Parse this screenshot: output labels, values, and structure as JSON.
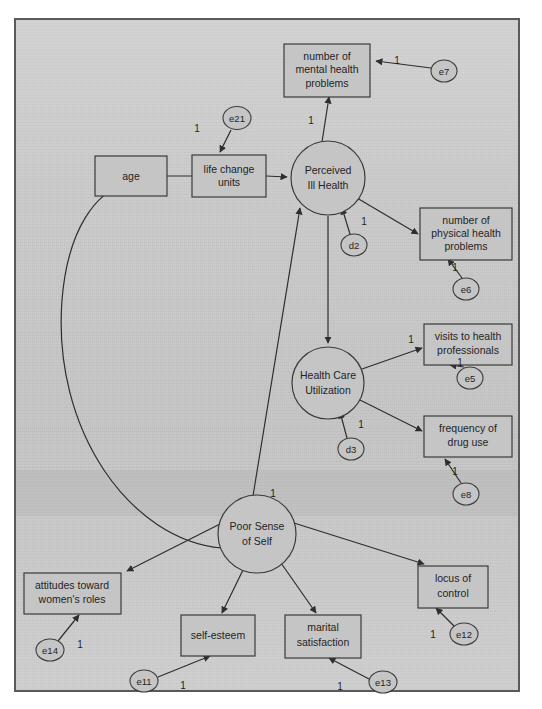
{
  "figure": {
    "kind": "path-diagram",
    "background_color": "#c9c9c9",
    "frame_border_color": "#5a5a5a",
    "shape_fill_color": "#c5c5c5",
    "line_color": "#2e2e2e",
    "text_color": "#242424"
  },
  "observed_variables": [
    {
      "id": "age",
      "label": "age",
      "x": 131,
      "y": 176,
      "w": 72,
      "h": 40
    },
    {
      "id": "life_change_units",
      "label_line1": "life change",
      "label_line2": "units",
      "x": 229,
      "y": 176,
      "w": 74,
      "h": 42
    },
    {
      "id": "mental_health_problems",
      "label_line1": "number of",
      "label_line2": "mental health",
      "label_line3": "problems",
      "x": 327,
      "y": 68,
      "w": 86,
      "h": 48
    },
    {
      "id": "physical_health_problems",
      "label_line1": "number of",
      "label_line2": "physical health",
      "label_line3": "problems",
      "x": 466,
      "y": 232,
      "w": 92,
      "h": 48
    },
    {
      "id": "visits_to_health_professionals",
      "label_line1": "visits to health",
      "label_line2": "professionals",
      "x": 470,
      "y": 344,
      "w": 88,
      "h": 38
    },
    {
      "id": "frequency_of_drug_use",
      "label_line1": "frequency of",
      "label_line2": "drug use",
      "x": 470,
      "y": 437,
      "w": 88,
      "h": 38
    },
    {
      "id": "attitudes_toward_womens_roles",
      "label_line1": "attitudes toward",
      "label_line2": "women's roles",
      "x": 72,
      "y": 593,
      "w": 97,
      "h": 38
    },
    {
      "id": "self_esteem",
      "label": "self-esteem",
      "x": 218,
      "y": 636,
      "w": 74,
      "h": 36
    },
    {
      "id": "marital_satisfaction",
      "label_line1": "marital",
      "label_line2": "satisfaction",
      "x": 323,
      "y": 636,
      "w": 76,
      "h": 38
    },
    {
      "id": "locus_of_control",
      "label_line1": "locus of",
      "label_line2": "control",
      "x": 452,
      "y": 586,
      "w": 70,
      "h": 38
    }
  ],
  "latent_variables": [
    {
      "id": "perceived_ill_health",
      "label_line1": "Perceived",
      "label_line2": "Ill Health",
      "cx": 328,
      "cy": 178,
      "r": 37
    },
    {
      "id": "health_care_utilization",
      "label_line1": "Health Care",
      "label_line2": "Utilization",
      "cx": 328,
      "cy": 383,
      "r": 36
    },
    {
      "id": "poor_sense_of_self",
      "label_line1": "Poor Sense",
      "label_line2": "of Self",
      "cx": 257,
      "cy": 534,
      "r": 39
    }
  ],
  "error_terms": [
    {
      "id": "e21",
      "label": "e21",
      "cx": 237,
      "cy": 118,
      "rx": 14,
      "ry": 11,
      "target": "life_change_units",
      "coefficient": "1",
      "coef_x": 197,
      "coef_y": 129
    },
    {
      "id": "e7",
      "label": "e7",
      "cx": 444,
      "cy": 71,
      "rx": 13,
      "ry": 11,
      "target": "mental_health_problems",
      "coefficient": "1",
      "coef_x": 397,
      "coef_y": 61
    },
    {
      "id": "d2",
      "label": "d2",
      "cx": 354,
      "cy": 245,
      "rx": 13,
      "ry": 11,
      "target": "perceived_ill_health",
      "coefficient": "1",
      "coef_x": 362,
      "coef_y": 220
    },
    {
      "id": "e6",
      "label": "e6",
      "cx": 466,
      "cy": 289,
      "rx": 13,
      "ry": 11,
      "target": "physical_health_problems",
      "coefficient": "1",
      "coef_x": 455,
      "coef_y": 268
    },
    {
      "id": "e5",
      "label": "e5",
      "cx": 470,
      "cy": 378,
      "rx": 13,
      "ry": 11,
      "target": "visits_to_health_professionals",
      "coefficient": "1",
      "coef_x": 460,
      "coef_y": 365
    },
    {
      "id": "d3",
      "label": "d3",
      "cx": 351,
      "cy": 449,
      "rx": 13,
      "ry": 11,
      "target": "health_care_utilization",
      "coefficient": "1",
      "coef_x": 359,
      "coef_y": 424
    },
    {
      "id": "e8",
      "label": "e8",
      "cx": 466,
      "cy": 494,
      "rx": 13,
      "ry": 11,
      "target": "frequency_of_drug_use",
      "coefficient": "1",
      "coef_x": 455,
      "coef_y": 472
    },
    {
      "id": "e14",
      "label": "e14",
      "cx": 50,
      "cy": 650,
      "rx": 14,
      "ry": 11,
      "target": "attitudes_toward_womens_roles",
      "coefficient": "1",
      "coef_x": 80,
      "coef_y": 645
    },
    {
      "id": "e11",
      "label": "e11",
      "cx": 144,
      "cy": 681,
      "rx": 14,
      "ry": 11,
      "target": "self_esteem",
      "coefficient": "1",
      "coef_x": 183,
      "coef_y": 685
    },
    {
      "id": "e13",
      "label": "e13",
      "cx": 383,
      "cy": 682,
      "rx": 14,
      "ry": 11,
      "target": "marital_satisfaction",
      "coefficient": "1",
      "coef_x": 340,
      "coef_y": 686
    },
    {
      "id": "e12",
      "label": "e12",
      "cx": 464,
      "cy": 634,
      "rx": 14,
      "ry": 11,
      "target": "locus_of_control",
      "coefficient": "1",
      "coef_x": 434,
      "coef_y": 634
    }
  ],
  "structural_paths": [
    {
      "from": "age",
      "to": "life_change_units",
      "coefficient": ""
    },
    {
      "from": "life_change_units",
      "to": "perceived_ill_health",
      "coefficient": ""
    },
    {
      "from": "perceived_ill_health",
      "to": "mental_health_problems",
      "coefficient": "1",
      "coef_x": 311,
      "coef_y": 121
    },
    {
      "from": "perceived_ill_health",
      "to": "physical_health_problems",
      "coefficient": ""
    },
    {
      "from": "perceived_ill_health",
      "to": "health_care_utilization",
      "coefficient": ""
    },
    {
      "from": "health_care_utilization",
      "to": "visits_to_health_professionals",
      "coefficient": "1",
      "coef_x": 411,
      "coef_y": 341
    },
    {
      "from": "health_care_utilization",
      "to": "frequency_of_drug_use",
      "coefficient": ""
    },
    {
      "from": "poor_sense_of_self",
      "to": "perceived_ill_health",
      "coefficient": "1",
      "coef_x": 272,
      "coef_y": 494
    },
    {
      "from": "poor_sense_of_self",
      "to": "attitudes_toward_womens_roles",
      "coefficient": ""
    },
    {
      "from": "poor_sense_of_self",
      "to": "self_esteem",
      "coefficient": ""
    },
    {
      "from": "poor_sense_of_self",
      "to": "marital_satisfaction",
      "coefficient": ""
    },
    {
      "from": "poor_sense_of_self",
      "to": "locus_of_control",
      "coefficient": ""
    },
    {
      "from": "poor_sense_of_self",
      "to": "age",
      "coefficient": "",
      "curved": true
    }
  ]
}
